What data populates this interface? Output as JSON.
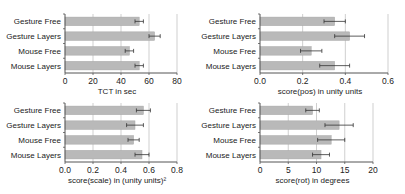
{
  "style": {
    "bar_fill": "#b9b9b9",
    "bar_stroke": "#a6a6a6",
    "axis_color": "#555555",
    "grid_color": "#cfcfcf",
    "errorbar_color": "#333333"
  },
  "chart_data": [
    {
      "type": "bar",
      "orientation": "horizontal",
      "categories": [
        "Gesture Free",
        "Gesture Layers",
        "Mouse Free",
        "Mouse Layers"
      ],
      "values": [
        53,
        64,
        46,
        53
      ],
      "errors": [
        3,
        4,
        3,
        3
      ],
      "title": "",
      "xlabel": "TCT in sec",
      "ylabel": "",
      "xlim": [
        0,
        80
      ],
      "xticks": [
        0,
        20,
        40,
        60,
        80
      ],
      "xtick_labels": [
        "0",
        "20",
        "40",
        "60",
        "80"
      ],
      "grid": "vertical",
      "legend": "none"
    },
    {
      "type": "bar",
      "orientation": "horizontal",
      "categories": [
        "Gesture Free",
        "Gesture Layers",
        "Mouse Free",
        "Mouse Layers"
      ],
      "values": [
        0.35,
        0.42,
        0.24,
        0.35
      ],
      "errors": [
        0.05,
        0.07,
        0.05,
        0.07
      ],
      "title": "",
      "xlabel": "score(pos) in unity units",
      "ylabel": "",
      "xlim": [
        0,
        0.6
      ],
      "xticks": [
        0,
        0.2,
        0.4,
        0.6
      ],
      "xtick_labels": [
        "0.0",
        "0.2",
        "0.4",
        "0.6"
      ],
      "grid": "vertical",
      "legend": "none"
    },
    {
      "type": "bar",
      "orientation": "horizontal",
      "categories": [
        "Gesture Free",
        "Gesture Layers",
        "Mouse Free",
        "Mouse Layers"
      ],
      "values": [
        0.56,
        0.5,
        0.49,
        0.55
      ],
      "errors": [
        0.05,
        0.06,
        0.04,
        0.05
      ],
      "title": "",
      "xlabel": "score(scale) in (unity units)²",
      "ylabel": "",
      "xlim": [
        0,
        0.8
      ],
      "xticks": [
        0,
        0.2,
        0.4,
        0.6,
        0.8
      ],
      "xtick_labels": [
        "0.0",
        "0.2",
        "0.4",
        "0.6",
        "0.8"
      ],
      "grid": "vertical",
      "legend": "none"
    },
    {
      "type": "bar",
      "orientation": "horizontal",
      "categories": [
        "Gesture Free",
        "Gesture Layers",
        "Mouse Free",
        "Mouse Layers"
      ],
      "values": [
        9.3,
        14.0,
        12.6,
        10.8
      ],
      "errors": [
        1.2,
        2.5,
        2.4,
        1.5
      ],
      "title": "",
      "xlabel": "score(rot) in degrees",
      "ylabel": "",
      "xlim": [
        0,
        20
      ],
      "xticks": [
        0,
        5,
        10,
        15,
        20
      ],
      "xtick_labels": [
        "0",
        "5",
        "10",
        "15",
        "20"
      ],
      "grid": "vertical",
      "legend": "none"
    }
  ]
}
